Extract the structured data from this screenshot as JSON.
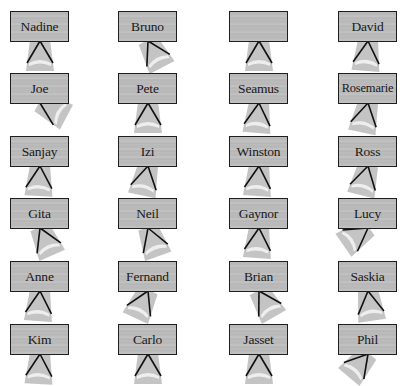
{
  "figure": {
    "colors": {
      "placard_fill": "#bababa",
      "placard_border": "#1e1e1e",
      "seat_shade": "#c4c4c4",
      "seat_highlight": "#eeeeee",
      "leg": "#111111",
      "text": "#1a1a1a"
    },
    "grid": {
      "columns": 4,
      "rows": 6,
      "col_x": [
        10,
        118,
        229,
        338
      ],
      "row_y": [
        11,
        73,
        136,
        198,
        261,
        324
      ]
    },
    "seats": [
      {
        "name": "Nadine",
        "row": 0,
        "col": 0,
        "rotation": 0
      },
      {
        "name": "Bruno",
        "row": 0,
        "col": 1,
        "rotation": -28
      },
      {
        "name": "",
        "row": 0,
        "col": 2,
        "rotation": 0
      },
      {
        "name": "David",
        "row": 0,
        "col": 3,
        "rotation": 5
      },
      {
        "name": "Joe",
        "row": 1,
        "col": 0,
        "rotation": -62
      },
      {
        "name": "Pete",
        "row": 1,
        "col": 1,
        "rotation": 0
      },
      {
        "name": "Seamus",
        "row": 1,
        "col": 2,
        "rotation": 5
      },
      {
        "name": "Rosemarie",
        "row": 1,
        "col": 3,
        "rotation": 12
      },
      {
        "name": "Sanjay",
        "row": 2,
        "col": 0,
        "rotation": 3
      },
      {
        "name": "Izi",
        "row": 2,
        "col": 1,
        "rotation": 12
      },
      {
        "name": "Winston",
        "row": 2,
        "col": 2,
        "rotation": 4
      },
      {
        "name": "Ross",
        "row": 2,
        "col": 3,
        "rotation": 14
      },
      {
        "name": "Gita",
        "row": 3,
        "col": 0,
        "rotation": -24
      },
      {
        "name": "Neil",
        "row": 3,
        "col": 1,
        "rotation": -20
      },
      {
        "name": "Gaynor",
        "row": 3,
        "col": 2,
        "rotation": 4
      },
      {
        "name": "Lucy",
        "row": 3,
        "col": 3,
        "rotation": 55
      },
      {
        "name": "Anne",
        "row": 4,
        "col": 0,
        "rotation": 4
      },
      {
        "name": "Fernand",
        "row": 4,
        "col": 1,
        "rotation": 25
      },
      {
        "name": "Brian",
        "row": 4,
        "col": 2,
        "rotation": -30
      },
      {
        "name": "Saskia",
        "row": 4,
        "col": 3,
        "rotation": -8
      },
      {
        "name": "Kim",
        "row": 5,
        "col": 0,
        "rotation": 3
      },
      {
        "name": "Carlo",
        "row": 5,
        "col": 1,
        "rotation": 0
      },
      {
        "name": "Jasset",
        "row": 5,
        "col": 2,
        "rotation": 0
      },
      {
        "name": "Phil",
        "row": 5,
        "col": 3,
        "rotation": 40
      }
    ]
  }
}
